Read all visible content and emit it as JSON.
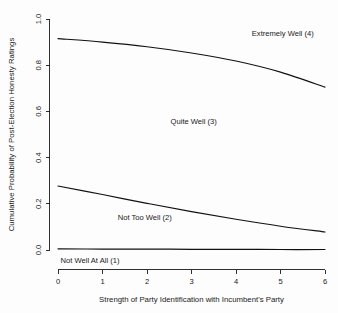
{
  "chart_data": {
    "type": "line",
    "title": "",
    "xlabel": "Strength of Party Identification with Incumbent's Party",
    "ylabel": "Cumulative Probability of Post-Election Honesty Ratings",
    "xlim": [
      0,
      6
    ],
    "ylim": [
      0,
      1
    ],
    "xticks": [
      0,
      1,
      2,
      3,
      4,
      5,
      6
    ],
    "xtick_labels": [
      "0",
      "1",
      "2",
      "3",
      "4",
      "5",
      "6"
    ],
    "yticks": [
      0.0,
      0.2,
      0.4,
      0.6,
      0.8,
      1.0
    ],
    "ytick_labels": [
      "0.0",
      "0.2",
      "0.4",
      "0.6",
      "0.8",
      "1.0"
    ],
    "grid": false,
    "legend_position": "inline-annotations",
    "x": [
      0,
      1,
      2,
      3,
      4,
      5,
      6
    ],
    "series": [
      {
        "name": "Extremely Well (4) boundary",
        "values": [
          0.915,
          0.9,
          0.88,
          0.853,
          0.818,
          0.77,
          0.705
        ]
      },
      {
        "name": "Not Too Well (2) boundary",
        "values": [
          0.277,
          0.24,
          0.202,
          0.166,
          0.133,
          0.103,
          0.078
        ]
      },
      {
        "name": "Not Well At All (1) boundary",
        "values": [
          0.005,
          0.004,
          0.004,
          0.003,
          0.003,
          0.002,
          0.002
        ]
      }
    ],
    "annotations": [
      {
        "text": "Extremely Well (4)",
        "x": 5.05,
        "y": 0.925
      },
      {
        "text": "Quite Well (3)",
        "x": 3.05,
        "y": 0.545
      },
      {
        "text": "Not Too Well (2)",
        "x": 1.95,
        "y": 0.13
      },
      {
        "text": "Not Well At All (1)",
        "x": 0.72,
        "y": -0.055
      }
    ]
  },
  "axes": {
    "y_title": "Cumulative Probability of Post-Election Honesty Ratings",
    "x_title": "Strength of Party Identification with Incumbent's Party",
    "y_tick_0": "0.0",
    "y_tick_1": "0.2",
    "y_tick_2": "0.4",
    "y_tick_3": "0.6",
    "y_tick_4": "0.8",
    "y_tick_5": "1.0",
    "x_tick_0": "0",
    "x_tick_1": "1",
    "x_tick_2": "2",
    "x_tick_3": "3",
    "x_tick_4": "4",
    "x_tick_5": "5",
    "x_tick_6": "6"
  },
  "labels": {
    "extremely_well": "Extremely Well (4)",
    "quite_well": "Quite Well (3)",
    "not_too_well": "Not Too Well (2)",
    "not_well_at_all": "Not Well At All (1)"
  },
  "colors": {
    "curve": "#111111",
    "axis": "#1a1a1a",
    "background": "#fdfdfd"
  }
}
